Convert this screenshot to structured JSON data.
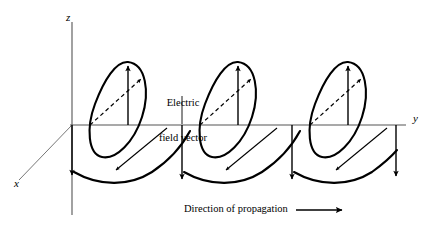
{
  "figure": {
    "type": "wave-diagram",
    "background_color": "#ffffff",
    "stroke_color": "#000000"
  },
  "axes": {
    "z": {
      "label": "z",
      "orientation": "vertical-up"
    },
    "y": {
      "label": "y",
      "orientation": "horizontal-right"
    },
    "x": {
      "label": "x",
      "orientation": "diagonal-down-left"
    }
  },
  "annotations": {
    "electric_field": {
      "line1": "Electric",
      "line2": "field vector"
    },
    "propagation": {
      "label": "Direction of propagation",
      "arrow": "right-arrow"
    }
  },
  "wave": {
    "loops": 3,
    "loop_centers_x": [
      128,
      238,
      348
    ],
    "vector_kind": "electric field vector",
    "up_arrow_count": 3,
    "down_arrow_count": 4,
    "dashed_arrow_count": 3,
    "solid_diagonal_arrow_count": 3
  }
}
